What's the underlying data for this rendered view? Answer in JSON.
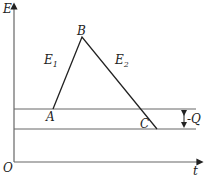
{
  "axes": {
    "y_label": "E",
    "x_label": "t",
    "origin_label": "O"
  },
  "points": {
    "A": "A",
    "B": "B",
    "C": "C"
  },
  "segments": {
    "e1": "E",
    "e1_sub": "1",
    "e2": "E",
    "e2_sub": "2"
  },
  "annotation": {
    "q_label": "-Q"
  },
  "colors": {
    "line": "#222222",
    "level": "#666666"
  }
}
